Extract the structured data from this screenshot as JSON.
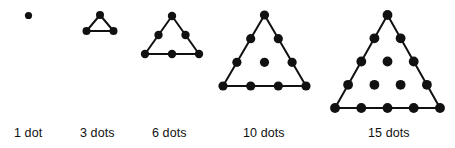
{
  "figure": {
    "background_color": "#ffffff",
    "dot_color": "#111111",
    "line_color": "#111111",
    "label_color": "#111111",
    "groups": [
      {
        "name": "one-dot",
        "label": "1 dot",
        "count": 1,
        "rows": 1,
        "label_x": 14,
        "label_y": 127,
        "dot_radius": 3.6,
        "show_outline": false,
        "dots": [
          {
            "x": 28.5,
            "y": 15.5
          }
        ],
        "outline": []
      },
      {
        "name": "three-dots",
        "label": "3 dots",
        "count": 3,
        "rows": 2,
        "label_x": 80,
        "label_y": 127,
        "dot_radius": 4.0,
        "show_outline": true,
        "dots": [
          {
            "x": 100.0,
            "y": 15.0
          },
          {
            "x": 86.5,
            "y": 31.0
          },
          {
            "x": 113.5,
            "y": 31.0
          }
        ],
        "outline": [
          {
            "x": 100.0,
            "y": 15.0
          },
          {
            "x": 86.5,
            "y": 31.0
          },
          {
            "x": 113.5,
            "y": 31.0
          }
        ]
      },
      {
        "name": "six-dots",
        "label": "6 dots",
        "count": 6,
        "rows": 3,
        "label_x": 152,
        "label_y": 127,
        "dot_radius": 4.2,
        "show_outline": true,
        "dots": [
          {
            "x": 172.0,
            "y": 16.0
          },
          {
            "x": 158.5,
            "y": 35.0
          },
          {
            "x": 185.5,
            "y": 35.0
          },
          {
            "x": 145.0,
            "y": 54.0
          },
          {
            "x": 172.0,
            "y": 54.0
          },
          {
            "x": 199.0,
            "y": 54.0
          }
        ],
        "outline": [
          {
            "x": 172.0,
            "y": 16.0
          },
          {
            "x": 145.0,
            "y": 54.0
          },
          {
            "x": 199.0,
            "y": 54.0
          }
        ]
      },
      {
        "name": "ten-dots",
        "label": "10 dots",
        "count": 10,
        "rows": 4,
        "label_x": 243,
        "label_y": 127,
        "dot_radius": 4.6,
        "show_outline": true,
        "dots": [
          {
            "x": 264.5,
            "y": 15.0
          },
          {
            "x": 250.7,
            "y": 38.7
          },
          {
            "x": 278.3,
            "y": 38.7
          },
          {
            "x": 236.9,
            "y": 62.3
          },
          {
            "x": 264.5,
            "y": 62.3
          },
          {
            "x": 292.1,
            "y": 62.3
          },
          {
            "x": 223.0,
            "y": 86.0
          },
          {
            "x": 250.7,
            "y": 86.0
          },
          {
            "x": 278.3,
            "y": 86.0
          },
          {
            "x": 306.0,
            "y": 86.0
          }
        ],
        "outline": [
          {
            "x": 264.5,
            "y": 15.0
          },
          {
            "x": 223.0,
            "y": 86.0
          },
          {
            "x": 306.0,
            "y": 86.0
          }
        ]
      },
      {
        "name": "fifteen-dots",
        "label": "15 dots",
        "count": 15,
        "rows": 5,
        "label_x": 368,
        "label_y": 127,
        "dot_radius": 4.9,
        "show_outline": true,
        "dots": [
          {
            "x": 387.5,
            "y": 15.0
          },
          {
            "x": 374.4,
            "y": 38.3
          },
          {
            "x": 400.6,
            "y": 38.3
          },
          {
            "x": 361.3,
            "y": 61.5
          },
          {
            "x": 387.5,
            "y": 61.5
          },
          {
            "x": 413.7,
            "y": 61.5
          },
          {
            "x": 348.1,
            "y": 84.8
          },
          {
            "x": 374.4,
            "y": 84.8
          },
          {
            "x": 400.6,
            "y": 84.8
          },
          {
            "x": 426.9,
            "y": 84.8
          },
          {
            "x": 335.0,
            "y": 108.0
          },
          {
            "x": 361.3,
            "y": 108.0
          },
          {
            "x": 387.5,
            "y": 108.0
          },
          {
            "x": 413.7,
            "y": 108.0
          },
          {
            "x": 440.0,
            "y": 108.0
          }
        ],
        "outline": [
          {
            "x": 387.5,
            "y": 15.0
          },
          {
            "x": 335.0,
            "y": 108.0
          },
          {
            "x": 440.0,
            "y": 108.0
          }
        ]
      }
    ]
  },
  "chart_data": {
    "type": "scatter",
    "categories": [
      "1 dot",
      "3 dots",
      "6 dots",
      "10 dots",
      "15 dots"
    ],
    "values": [
      1,
      3,
      6,
      10,
      15
    ],
    "xlabel": "",
    "ylabel": "",
    "legend": []
  }
}
